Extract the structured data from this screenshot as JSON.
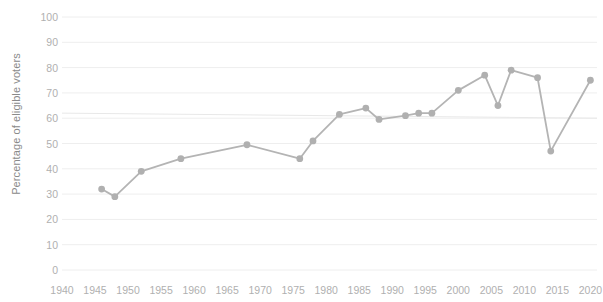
{
  "chart_data": {
    "type": "line",
    "title": "",
    "subtitle": "",
    "xlabel": "",
    "ylabel": "Percentage of eligible voters",
    "xlim": [
      1940,
      2021
    ],
    "ylim": [
      0,
      100
    ],
    "grid": true,
    "legend": null,
    "xticks": [
      1940,
      1945,
      1950,
      1955,
      1960,
      1965,
      1970,
      1975,
      1980,
      1985,
      1990,
      1995,
      2000,
      2005,
      2010,
      2015,
      2020
    ],
    "yticks": [
      0,
      10,
      20,
      30,
      40,
      50,
      60,
      70,
      80,
      90,
      100
    ],
    "line_color": "#b4b4b4",
    "marker_color": "#b0b0b0",
    "grid_color": "#eeeeee",
    "trendline": {
      "x": [
        1940,
        2021
      ],
      "y": [
        62,
        60
      ],
      "color": "#e6e6e6"
    },
    "series": [
      {
        "name": "Voter turnout",
        "x": [
          1946,
          1948,
          1952,
          1958,
          1968,
          1976,
          1978,
          1982,
          1986,
          1988,
          1992,
          1994,
          1996,
          2000,
          2004,
          2006,
          2008,
          2012,
          2014,
          2020
        ],
        "values": [
          32,
          29,
          39,
          44,
          49.5,
          44,
          51,
          61.5,
          64,
          59.5,
          61,
          62,
          62,
          71,
          77,
          65,
          79,
          76,
          47,
          75
        ]
      }
    ]
  }
}
